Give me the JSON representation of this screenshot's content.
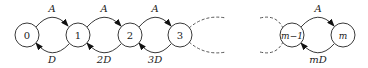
{
  "diagram": {
    "type": "birth-death chain",
    "nodes": [
      {
        "id": "0",
        "label": "0",
        "cx": 27
      },
      {
        "id": "1",
        "label": "1",
        "cx": 78
      },
      {
        "id": "2",
        "label": "2",
        "cx": 130
      },
      {
        "id": "3",
        "label": "3",
        "cx": 180
      },
      {
        "id": "m-1",
        "label": "m−1",
        "cx": 292
      },
      {
        "id": "m",
        "label": "m",
        "cx": 343
      }
    ],
    "forward_edges": [
      {
        "from": "0",
        "to": "1",
        "label": "A"
      },
      {
        "from": "1",
        "to": "2",
        "label": "A"
      },
      {
        "from": "2",
        "to": "3",
        "label": "A"
      },
      {
        "from": "m-1",
        "to": "m",
        "label": "A"
      }
    ],
    "backward_edges": [
      {
        "from": "1",
        "to": "0",
        "label": "D"
      },
      {
        "from": "2",
        "to": "1",
        "label": "2D"
      },
      {
        "from": "3",
        "to": "2",
        "label": "3D"
      },
      {
        "from": "m",
        "to": "m-1",
        "label": "mD"
      }
    ]
  }
}
